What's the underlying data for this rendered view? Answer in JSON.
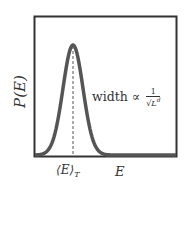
{
  "figure": {
    "ylabel": "P(E)",
    "xlabel": "E",
    "mean_label": "⟨E⟩",
    "mean_sub": "T",
    "annotation": {
      "text": "width ∝",
      "frac_num": "1",
      "frac_den": "√L",
      "frac_den_sup": "d"
    },
    "colors": {
      "curve": "#555555",
      "frame": "#333333",
      "dash": "#555555"
    }
  },
  "chart_data": {
    "type": "line",
    "title": "",
    "xlabel": "E",
    "ylabel": "P(E)",
    "series": [
      {
        "name": "Gaussian distribution P(E)",
        "shape": "gaussian",
        "center_label": "⟨E⟩_T",
        "relative_center": 0.27,
        "relative_width": 0.07
      }
    ],
    "annotations": [
      "width ∝ 1/√(L^d)",
      "dashed vertical line at ⟨E⟩_T"
    ],
    "grid": false
  }
}
